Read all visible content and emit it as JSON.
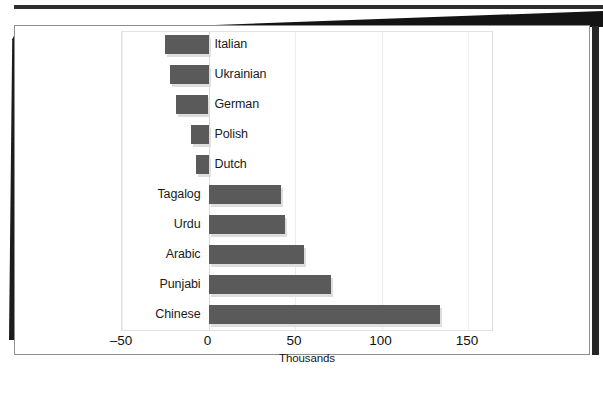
{
  "chart_data": {
    "type": "bar",
    "orientation": "horizontal",
    "title": "",
    "xlabel": "Thousands",
    "ylabel": "",
    "xlim": [
      -50,
      165
    ],
    "xticks": [
      -50,
      0,
      50,
      100,
      150
    ],
    "xticklabels": [
      "–50",
      "0",
      "50",
      "100",
      "150"
    ],
    "grid": true,
    "legend": "none",
    "categories": [
      "Italian",
      "Ukrainian",
      "German",
      "Polish",
      "Dutch",
      "Tagalog",
      "Urdu",
      "Arabic",
      "Punjabi",
      "Chinese"
    ],
    "values": [
      -25,
      -22,
      -19,
      -10,
      -7,
      42,
      44,
      55,
      71,
      134
    ],
    "units": "thousands",
    "bar_color": "#5a5a5a",
    "shadow_color": "#dedede"
  },
  "axis": {
    "title": "Thousands",
    "ticks": [
      {
        "label": "–50",
        "value": -50
      },
      {
        "label": "0",
        "value": 0
      },
      {
        "label": "50",
        "value": 50
      },
      {
        "label": "100",
        "value": 100
      },
      {
        "label": "150",
        "value": 150
      }
    ]
  },
  "bars": [
    {
      "label": "Italian",
      "value": -25
    },
    {
      "label": "Ukrainian",
      "value": -22
    },
    {
      "label": "German",
      "value": -19
    },
    {
      "label": "Polish",
      "value": -10
    },
    {
      "label": "Dutch",
      "value": -7
    },
    {
      "label": "Tagalog",
      "value": 42
    },
    {
      "label": "Urdu",
      "value": 44
    },
    {
      "label": "Arabic",
      "value": 55
    },
    {
      "label": "Punjabi",
      "value": 71
    },
    {
      "label": "Chinese",
      "value": 134
    }
  ],
  "caption": {
    "sliver_text": ""
  }
}
